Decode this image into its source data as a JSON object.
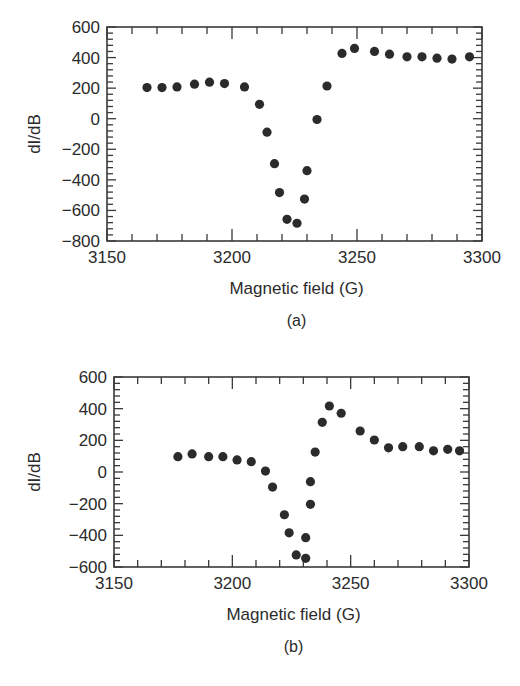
{
  "chart_data": [
    {
      "id": "a",
      "type": "scatter",
      "caption": "(a)",
      "title": "",
      "xlabel": "Magnetic field (G)",
      "ylabel": "dI/dB",
      "xlim": [
        3150,
        3300
      ],
      "ylim": [
        -800,
        600
      ],
      "xticks": [
        3150,
        3200,
        3250,
        3300
      ],
      "yticks": [
        -800,
        -600,
        -400,
        -200,
        0,
        200,
        400,
        600
      ],
      "grid": false,
      "legend": null,
      "marker_color": "#2b2b2b",
      "points": [
        {
          "x": 3166,
          "y": 204
        },
        {
          "x": 3172,
          "y": 204
        },
        {
          "x": 3178,
          "y": 208
        },
        {
          "x": 3185,
          "y": 226
        },
        {
          "x": 3191,
          "y": 239
        },
        {
          "x": 3197,
          "y": 230
        },
        {
          "x": 3205,
          "y": 208
        },
        {
          "x": 3211,
          "y": 94
        },
        {
          "x": 3214,
          "y": -88
        },
        {
          "x": 3217,
          "y": -294
        },
        {
          "x": 3219,
          "y": -483
        },
        {
          "x": 3222,
          "y": -658
        },
        {
          "x": 3226,
          "y": -684
        },
        {
          "x": 3229,
          "y": -526
        },
        {
          "x": 3230,
          "y": -340
        },
        {
          "x": 3234,
          "y": -5
        },
        {
          "x": 3238,
          "y": 214
        },
        {
          "x": 3244,
          "y": 427
        },
        {
          "x": 3249,
          "y": 460
        },
        {
          "x": 3257,
          "y": 440
        },
        {
          "x": 3263,
          "y": 422
        },
        {
          "x": 3270,
          "y": 405
        },
        {
          "x": 3276,
          "y": 405
        },
        {
          "x": 3282,
          "y": 396
        },
        {
          "x": 3288,
          "y": 390
        },
        {
          "x": 3295,
          "y": 405
        }
      ]
    },
    {
      "id": "b",
      "type": "scatter",
      "caption": "(b)",
      "title": "",
      "xlabel": "Magnetic field (G)",
      "ylabel": "dI/dB",
      "xlim": [
        3150,
        3300
      ],
      "ylim": [
        -600,
        600
      ],
      "xticks": [
        3150,
        3200,
        3250,
        3300
      ],
      "yticks": [
        -600,
        -400,
        -200,
        0,
        200,
        400,
        600
      ],
      "grid": false,
      "legend": null,
      "marker_color": "#2b2b2b",
      "points": [
        {
          "x": 3177,
          "y": 97
        },
        {
          "x": 3183,
          "y": 114
        },
        {
          "x": 3190,
          "y": 97
        },
        {
          "x": 3196,
          "y": 97
        },
        {
          "x": 3202,
          "y": 76
        },
        {
          "x": 3208,
          "y": 65
        },
        {
          "x": 3214,
          "y": 6
        },
        {
          "x": 3217,
          "y": -95
        },
        {
          "x": 3222,
          "y": -270
        },
        {
          "x": 3224,
          "y": -384
        },
        {
          "x": 3227,
          "y": -524
        },
        {
          "x": 3231,
          "y": -545
        },
        {
          "x": 3231,
          "y": -415
        },
        {
          "x": 3233,
          "y": -204
        },
        {
          "x": 3233,
          "y": -61
        },
        {
          "x": 3235,
          "y": 126
        },
        {
          "x": 3238,
          "y": 314
        },
        {
          "x": 3241,
          "y": 417
        },
        {
          "x": 3246,
          "y": 371
        },
        {
          "x": 3254,
          "y": 259
        },
        {
          "x": 3260,
          "y": 202
        },
        {
          "x": 3266,
          "y": 153
        },
        {
          "x": 3272,
          "y": 160
        },
        {
          "x": 3279,
          "y": 160
        },
        {
          "x": 3285,
          "y": 134
        },
        {
          "x": 3291,
          "y": 143
        },
        {
          "x": 3296,
          "y": 134
        }
      ]
    }
  ],
  "layout": {
    "a": {
      "left": 107,
      "right": 482,
      "top": 27,
      "bottom": 241,
      "yminor_step": 40,
      "xminor_step": 10
    },
    "b": {
      "left": 114,
      "right": 469,
      "top": 47,
      "bottom": 237,
      "yminor_step": 40,
      "xminor_step": 10
    }
  }
}
